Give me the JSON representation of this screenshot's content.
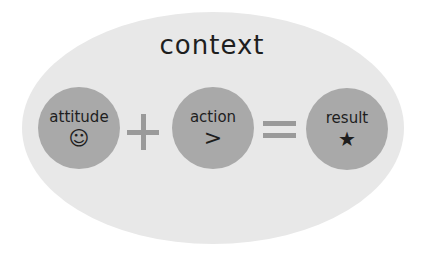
{
  "diagram": {
    "title": "context",
    "nodes": [
      {
        "label": "attitude",
        "icon": "☺",
        "icon_name": "smiley-icon"
      },
      {
        "label": "action",
        "icon": ">",
        "icon_name": "greater-than-icon"
      },
      {
        "label": "result",
        "icon": "★",
        "icon_name": "star-icon"
      }
    ],
    "operators": [
      "+",
      "="
    ],
    "colors": {
      "background_ellipse": "#e8e8e8",
      "node_fill": "#a9a9a9",
      "operator": "#9a9a9a",
      "text": "#1e1e1e"
    }
  }
}
